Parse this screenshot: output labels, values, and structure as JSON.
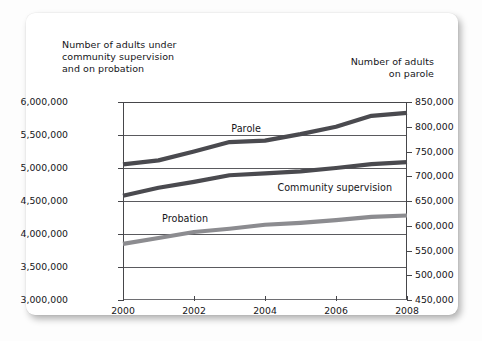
{
  "card": {
    "left_axis_caption": "Number of adults under\ncommunity supervision\nand on probation",
    "right_axis_caption": "Number of adults\non parole"
  },
  "chart_data": {
    "type": "line",
    "title": "",
    "subtitle": "",
    "xlabel": "",
    "ylabel": "Number of adults under community supervision and on probation",
    "y2label": "Number of adults on parole",
    "grid": true,
    "legend": "inline-series-labels",
    "x": [
      2000,
      2001,
      2002,
      2003,
      2004,
      2005,
      2006,
      2007,
      2008
    ],
    "xtick_labels": [
      "2000",
      "2002",
      "2004",
      "2006",
      "2008"
    ],
    "xtick_values": [
      2000,
      2002,
      2004,
      2006,
      2008
    ],
    "xlim": [
      2000,
      2008
    ],
    "ylim": [
      3000000,
      6000000
    ],
    "ytick_labels": [
      "6,000,000",
      "5,500,000",
      "5,000,000",
      "4,500,000",
      "4,000,000",
      "3,500,000",
      "3,000,000"
    ],
    "ytick_values": [
      6000000,
      5500000,
      5000000,
      4500000,
      4000000,
      3500000,
      3000000
    ],
    "y2lim": [
      450000,
      850000
    ],
    "y2tick_labels": [
      "850,000",
      "800,000",
      "750,000",
      "700,000",
      "650,000",
      "600,000",
      "550,000",
      "500,000",
      "450,000"
    ],
    "y2tick_values": [
      850000,
      800000,
      750000,
      700000,
      650000,
      600000,
      550000,
      500000,
      450000
    ],
    "series": [
      {
        "name": "Parole",
        "axis": "right",
        "color": "#4a4a4f",
        "values": [
          724000,
          732000,
          750000,
          769000,
          772000,
          785000,
          800000,
          822000,
          828000
        ]
      },
      {
        "name": "Community supervision",
        "axis": "left",
        "color": "#4a4a4f",
        "values": [
          4580000,
          4700000,
          4790000,
          4890000,
          4920000,
          4950000,
          5000000,
          5060000,
          5090000
        ]
      },
      {
        "name": "Probation",
        "axis": "left",
        "color": "#8c8c90",
        "values": [
          3850000,
          3940000,
          4030000,
          4080000,
          4140000,
          4170000,
          4210000,
          4260000,
          4280000
        ]
      }
    ],
    "annotations": [
      {
        "text": "Parole",
        "x": 2003.05,
        "y": 795000,
        "axis": "right"
      },
      {
        "text": "Community supervision",
        "x": 2004.35,
        "y": 4700000,
        "axis": "left"
      },
      {
        "text": "Probation",
        "x": 2001.1,
        "y": 4230000,
        "axis": "left"
      }
    ]
  }
}
